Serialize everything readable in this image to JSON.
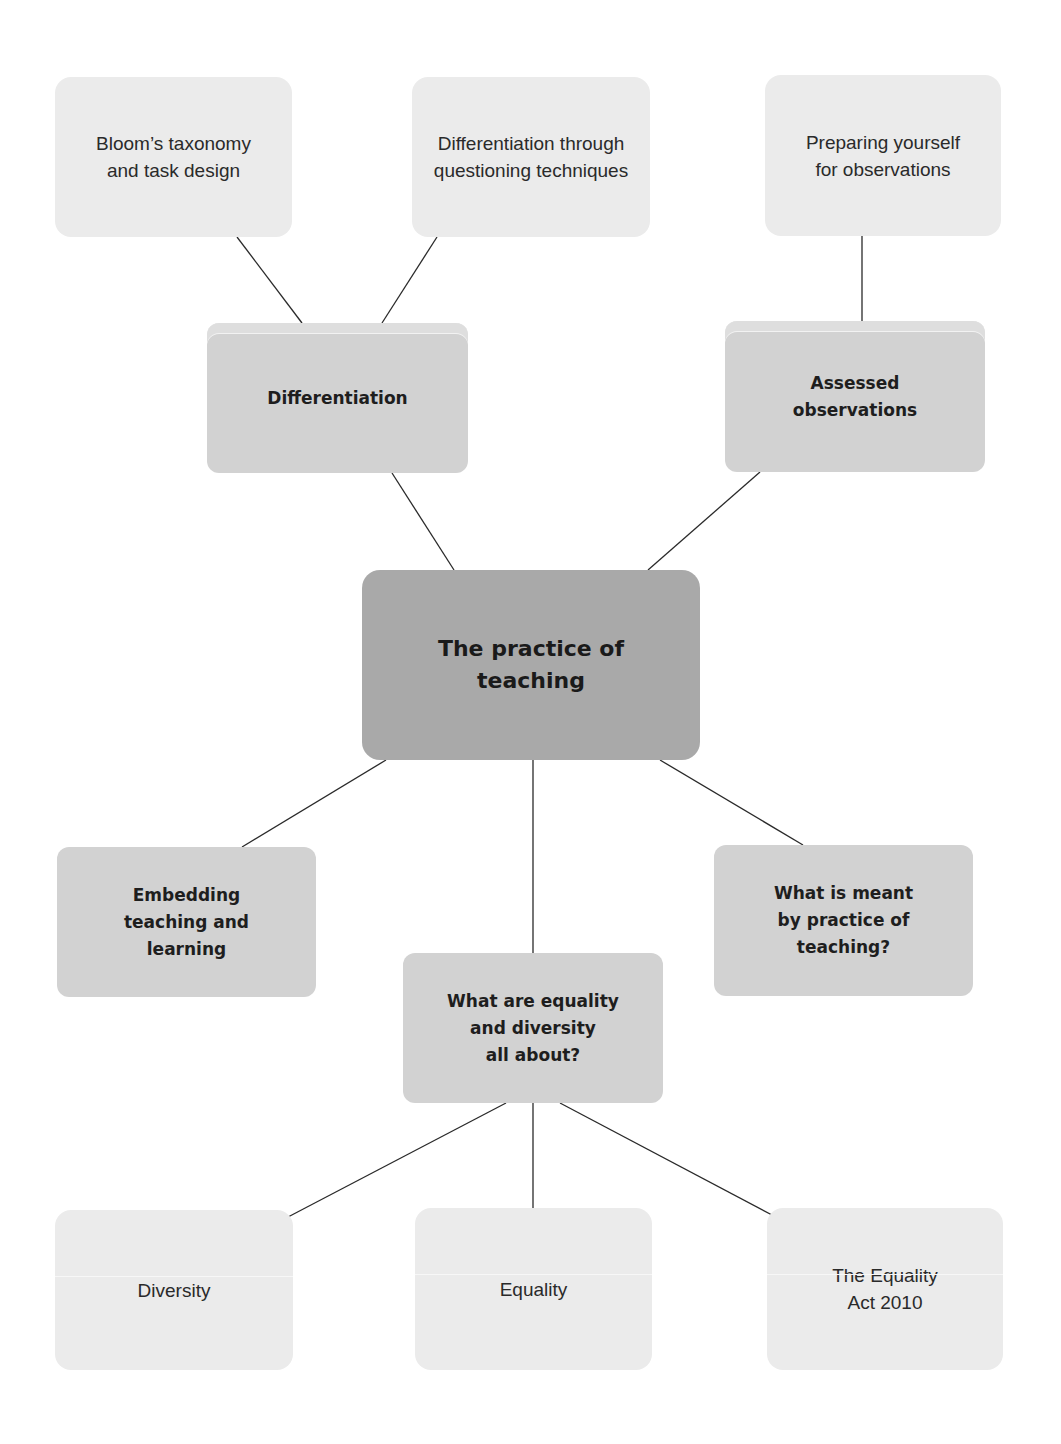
{
  "diagram": {
    "type": "mind-map",
    "colors": {
      "central_fill": "#a9a9a9",
      "branch_fill": "#d2d2d2",
      "leaf_fill": "#ebebeb",
      "line": "#2a2a2a",
      "background": "#ffffff"
    },
    "central": {
      "label": "The practice of\nteaching"
    },
    "branches": [
      {
        "id": "differentiation",
        "label": "Differentiation",
        "children": [
          {
            "id": "blooms",
            "label": "Bloom’s taxonomy\nand task design"
          },
          {
            "id": "questioning",
            "label": "Differentiation through\nquestioning techniques"
          }
        ]
      },
      {
        "id": "assessed",
        "label": "Assessed\nobservations",
        "children": [
          {
            "id": "preparing",
            "label": "Preparing yourself\nfor observations"
          }
        ]
      },
      {
        "id": "embedding",
        "label": "Embedding\nteaching and\nlearning",
        "children": []
      },
      {
        "id": "equality-diversity",
        "label": "What are equality\nand diversity\nall about?",
        "children": [
          {
            "id": "diversity",
            "label": "Diversity"
          },
          {
            "id": "equality",
            "label": "Equality"
          },
          {
            "id": "equality-act",
            "label": "The Equality\nAct 2010"
          }
        ]
      },
      {
        "id": "meaning",
        "label": "What is meant\nby practice of\nteaching?",
        "children": []
      }
    ]
  }
}
